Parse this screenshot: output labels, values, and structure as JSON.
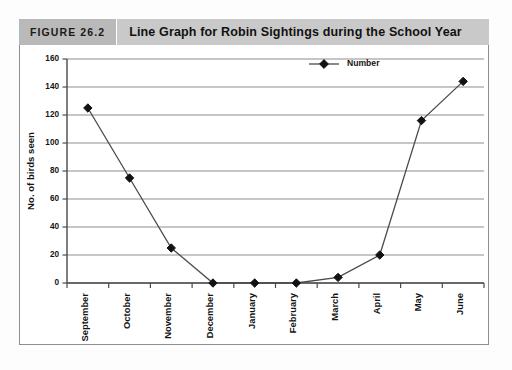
{
  "figure": {
    "tag": "FIGURE 26.2",
    "title": "Line Graph for Robin Sightings during the School Year"
  },
  "colors": {
    "tag_background": "#b9b9b9",
    "title_background": "#c9c9c9",
    "frame_border": "#8f8f8f",
    "gridline": "#8d8d8d",
    "axis": "#4a4a4a",
    "series_line": "#4b4b4b",
    "marker": "#121212",
    "text": "#141414",
    "plot_background": "#ffffff"
  },
  "chart_data": {
    "type": "line",
    "title": "Line Graph for Robin Sightings during the School Year",
    "xlabel": "",
    "ylabel": "No. of birds seen",
    "categories": [
      "September",
      "October",
      "November",
      "December",
      "January",
      "February",
      "March",
      "April",
      "May",
      "June"
    ],
    "series": [
      {
        "name": "Number",
        "marker": "diamond",
        "values": [
          125,
          75,
          25,
          0,
          0,
          0,
          4,
          20,
          116,
          144
        ]
      }
    ],
    "ylim": [
      0,
      160
    ],
    "ytick_values": [
      0,
      20,
      40,
      60,
      80,
      100,
      120,
      140,
      160
    ],
    "ytick_labels": [
      "0",
      "20",
      "40",
      "60",
      "80",
      "100",
      "120",
      "140",
      "160"
    ],
    "grid": true,
    "grid_axis": "y",
    "legend": [
      "Number"
    ],
    "legend_position": "top-center",
    "xtick_rotation": 90
  }
}
